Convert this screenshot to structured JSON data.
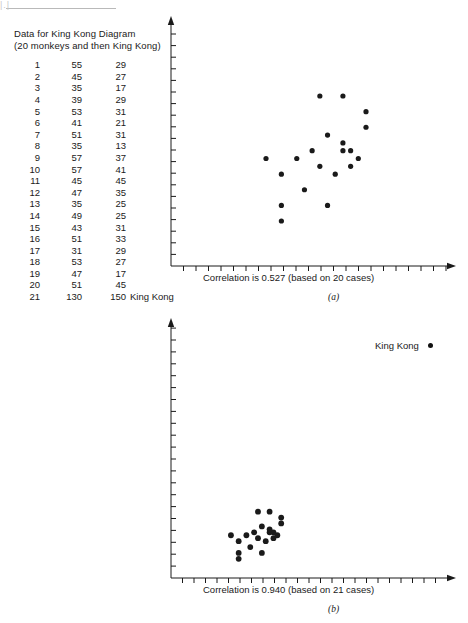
{
  "page": {
    "corner_mark": "|.|",
    "background": "#ffffff",
    "ink": "#1a1a1a"
  },
  "data_table": {
    "title_line1": "Data for King Kong Diagram",
    "title_line2": "(20 monkeys and then King Kong)",
    "rows": [
      {
        "idx": "1",
        "x": "55",
        "y": "29",
        "note": ""
      },
      {
        "idx": "2",
        "x": "45",
        "y": "27",
        "note": ""
      },
      {
        "idx": "3",
        "x": "35",
        "y": "17",
        "note": ""
      },
      {
        "idx": "4",
        "x": "39",
        "y": "29",
        "note": ""
      },
      {
        "idx": "5",
        "x": "53",
        "y": "31",
        "note": ""
      },
      {
        "idx": "6",
        "x": "41",
        "y": "21",
        "note": ""
      },
      {
        "idx": "7",
        "x": "51",
        "y": "31",
        "note": ""
      },
      {
        "idx": "8",
        "x": "35",
        "y": "13",
        "note": ""
      },
      {
        "idx": "9",
        "x": "57",
        "y": "37",
        "note": ""
      },
      {
        "idx": "10",
        "x": "57",
        "y": "41",
        "note": ""
      },
      {
        "idx": "11",
        "x": "45",
        "y": "45",
        "note": ""
      },
      {
        "idx": "12",
        "x": "47",
        "y": "35",
        "note": ""
      },
      {
        "idx": "13",
        "x": "35",
        "y": "25",
        "note": ""
      },
      {
        "idx": "14",
        "x": "49",
        "y": "25",
        "note": ""
      },
      {
        "idx": "15",
        "x": "43",
        "y": "31",
        "note": ""
      },
      {
        "idx": "16",
        "x": "51",
        "y": "33",
        "note": ""
      },
      {
        "idx": "17",
        "x": "31",
        "y": "29",
        "note": ""
      },
      {
        "idx": "18",
        "x": "53",
        "y": "27",
        "note": ""
      },
      {
        "idx": "19",
        "x": "47",
        "y": "17",
        "note": ""
      },
      {
        "idx": "20",
        "x": "51",
        "y": "45",
        "note": ""
      },
      {
        "idx": "21",
        "x": "130",
        "y": "150",
        "note": "King Kong"
      }
    ]
  },
  "chart_data": [
    {
      "type": "scatter",
      "panel": "(a)",
      "caption": "Correlation is 0.527 (based on 20 cases)",
      "correlation": 0.527,
      "n_cases": 20,
      "title": "",
      "xlabel": "",
      "ylabel": "",
      "grid": false,
      "axis": {
        "x_ticks_count": 22,
        "y_ticks_count": 20,
        "arrows": true,
        "tick_labels": []
      },
      "note": "20 monkeys only; King Kong excluded. Axes unlabeled with bare tick marks.",
      "points": [
        {
          "i": 1,
          "x": 55,
          "y": 29
        },
        {
          "i": 2,
          "x": 45,
          "y": 27
        },
        {
          "i": 3,
          "x": 35,
          "y": 17
        },
        {
          "i": 4,
          "x": 39,
          "y": 29
        },
        {
          "i": 5,
          "x": 53,
          "y": 31
        },
        {
          "i": 6,
          "x": 41,
          "y": 21
        },
        {
          "i": 7,
          "x": 51,
          "y": 31
        },
        {
          "i": 8,
          "x": 35,
          "y": 13
        },
        {
          "i": 9,
          "x": 57,
          "y": 37
        },
        {
          "i": 10,
          "x": 57,
          "y": 41
        },
        {
          "i": 11,
          "x": 45,
          "y": 45
        },
        {
          "i": 12,
          "x": 47,
          "y": 35
        },
        {
          "i": 13,
          "x": 35,
          "y": 25
        },
        {
          "i": 14,
          "x": 49,
          "y": 25
        },
        {
          "i": 15,
          "x": 43,
          "y": 31
        },
        {
          "i": 16,
          "x": 51,
          "y": 33
        },
        {
          "i": 17,
          "x": 31,
          "y": 29
        },
        {
          "i": 18,
          "x": 53,
          "y": 27
        },
        {
          "i": 19,
          "x": 47,
          "y": 17
        },
        {
          "i": 20,
          "x": 51,
          "y": 45
        }
      ]
    },
    {
      "type": "scatter",
      "panel": "(b)",
      "caption": "Correlation is 0.940 (based on 21 cases)",
      "correlation": 0.94,
      "n_cases": 21,
      "title": "",
      "xlabel": "",
      "ylabel": "",
      "grid": false,
      "annotation": "King Kong",
      "axis": {
        "x_ticks_count": 24,
        "y_ticks_count": 21,
        "arrows": true,
        "tick_labels": []
      },
      "note": "Same 20 monkeys plus King Kong (130,150); rescaled axes compress the monkey cluster.",
      "points": [
        {
          "i": 1,
          "x": 55,
          "y": 29
        },
        {
          "i": 2,
          "x": 45,
          "y": 27
        },
        {
          "i": 3,
          "x": 35,
          "y": 17
        },
        {
          "i": 4,
          "x": 39,
          "y": 29
        },
        {
          "i": 5,
          "x": 53,
          "y": 31
        },
        {
          "i": 6,
          "x": 41,
          "y": 21
        },
        {
          "i": 7,
          "x": 51,
          "y": 31
        },
        {
          "i": 8,
          "x": 35,
          "y": 13
        },
        {
          "i": 9,
          "x": 57,
          "y": 37
        },
        {
          "i": 10,
          "x": 57,
          "y": 41
        },
        {
          "i": 11,
          "x": 45,
          "y": 45
        },
        {
          "i": 12,
          "x": 47,
          "y": 35
        },
        {
          "i": 13,
          "x": 35,
          "y": 25
        },
        {
          "i": 14,
          "x": 49,
          "y": 25
        },
        {
          "i": 15,
          "x": 43,
          "y": 31
        },
        {
          "i": 16,
          "x": 51,
          "y": 33
        },
        {
          "i": 17,
          "x": 31,
          "y": 29
        },
        {
          "i": 18,
          "x": 53,
          "y": 27
        },
        {
          "i": 19,
          "x": 47,
          "y": 17
        },
        {
          "i": 20,
          "x": 51,
          "y": 45
        },
        {
          "i": 21,
          "x": 130,
          "y": 150
        }
      ]
    }
  ]
}
